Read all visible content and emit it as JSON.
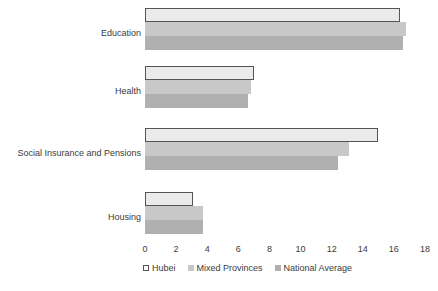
{
  "chart_data": {
    "type": "bar",
    "orientation": "horizontal",
    "title": "",
    "subtitle": "",
    "xlabel": "",
    "ylabel": "",
    "categories": [
      "Education",
      "Health",
      "Social Insurance and Pensions",
      "Housing"
    ],
    "series": [
      {
        "name": "Hubei",
        "values": [
          16.4,
          7.0,
          15.0,
          3.1
        ],
        "color": "#ebebeb",
        "border": "#555555"
      },
      {
        "name": "Mixed Provinces",
        "values": [
          16.8,
          6.8,
          13.1,
          3.7
        ],
        "color": "#c8c8c8",
        "border": ""
      },
      {
        "name": "National Average",
        "values": [
          16.6,
          6.6,
          12.4,
          3.7
        ],
        "color": "#b0b0b0",
        "border": ""
      }
    ],
    "xlim": [
      0,
      18
    ],
    "xticks": [
      "0",
      "2",
      "4",
      "6",
      "8",
      "10",
      "12",
      "14",
      "16",
      "18"
    ],
    "xtick_values": [
      0,
      2,
      4,
      6,
      8,
      10,
      12,
      14,
      16,
      18
    ],
    "grid": false,
    "legend_position": "bottom",
    "background_color": "#ffffff"
  },
  "legend": {
    "items": [
      {
        "label": "Hubei",
        "swatch": "hubei"
      },
      {
        "label": "Mixed Provinces",
        "swatch": "mixed"
      },
      {
        "label": "National Average",
        "swatch": "national"
      }
    ]
  }
}
